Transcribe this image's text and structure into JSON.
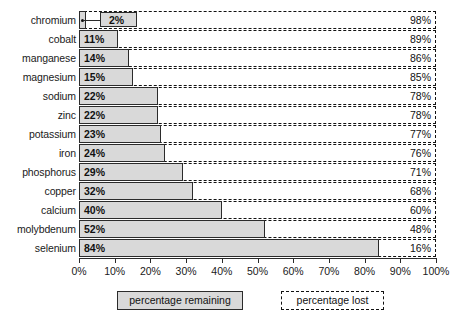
{
  "chart_data": {
    "type": "bar",
    "orientation": "horizontal",
    "title": "",
    "xlabel": "",
    "ylabel": "",
    "xlim": [
      0,
      100
    ],
    "xticks": [
      "0%",
      "10%",
      "20%",
      "30%",
      "40%",
      "50%",
      "60%",
      "70%",
      "80%",
      "90%",
      "100%"
    ],
    "xtick_values": [
      0,
      10,
      20,
      30,
      40,
      50,
      60,
      70,
      80,
      90,
      100
    ],
    "grid": false,
    "legend_position": "bottom",
    "categories": [
      "chromium",
      "cobalt",
      "manganese",
      "magnesium",
      "sodium",
      "zinc",
      "potassium",
      "iron",
      "phosphorus",
      "copper",
      "calcium",
      "molybdenum",
      "selenium"
    ],
    "series": [
      {
        "name": "percentage remaining",
        "values": [
          2,
          11,
          14,
          15,
          22,
          22,
          23,
          24,
          29,
          32,
          40,
          52,
          84
        ],
        "labels": [
          "2%",
          "11%",
          "14%",
          "15%",
          "22%",
          "22%",
          "23%",
          "24%",
          "29%",
          "32%",
          "40%",
          "52%",
          "84%"
        ],
        "style": "filled-gray-solid-border",
        "color": "#d9d9d9"
      },
      {
        "name": "percentage lost",
        "values": [
          98,
          89,
          86,
          85,
          78,
          78,
          77,
          76,
          71,
          68,
          60,
          48,
          16
        ],
        "labels": [
          "98%",
          "89%",
          "86%",
          "85%",
          "78%",
          "78%",
          "77%",
          "76%",
          "71%",
          "68%",
          "60%",
          "48%",
          "16%"
        ],
        "style": "dashed-outline",
        "color": "#ffffff"
      }
    ],
    "annotations": [
      {
        "category": "chromium",
        "text": "2%",
        "kind": "callout-box",
        "note": "value label drawn in a leader-line callout box because the bar is too small to contain it"
      }
    ]
  },
  "legend": {
    "remaining_label": "percentage remaining",
    "lost_label": "percentage lost"
  },
  "colors": {
    "bar_fill": "#d9d9d9",
    "bar_border": "#2b2b2b",
    "lost_border": "#111111",
    "background": "#ffffff",
    "text": "#1a1a1a"
  }
}
